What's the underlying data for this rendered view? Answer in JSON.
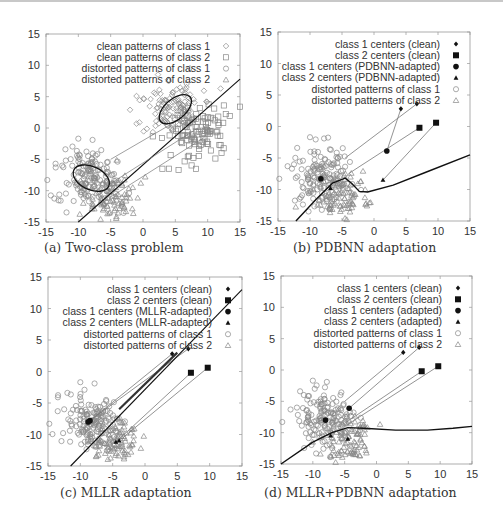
{
  "figure": {
    "panels": [
      {
        "id": "a",
        "caption": "(a) Two-class problem"
      },
      {
        "id": "b",
        "caption": "(b) PDBNN adaptation"
      },
      {
        "id": "c",
        "caption": "(c) MLLR adaptation"
      },
      {
        "id": "d",
        "caption": "(d) MLLR+PDBNN adaptation"
      }
    ]
  },
  "chart_data": [
    {
      "type": "scatter",
      "title": "(a) Two-class problem",
      "xlim": [
        -15,
        15
      ],
      "ylim": [
        -15,
        15
      ],
      "xticks": [
        -15,
        -10,
        -5,
        0,
        5,
        10,
        15
      ],
      "yticks": [
        -15,
        -10,
        -5,
        0,
        5,
        10,
        15
      ],
      "legend": [
        "clean patterns of class 1",
        "clean patterns of class 2",
        "distorted patterns of class 1",
        "distorted patterns of class 2"
      ],
      "legend_position": "upper right",
      "clusters": {
        "clean_class1_center": [
          5,
          3.5
        ],
        "clean_class2_center": [
          9,
          -0.5
        ],
        "distorted_class1_center": [
          -8,
          -8
        ],
        "distorted_class2_center": [
          -4,
          -11.5
        ]
      },
      "ellipses": [
        {
          "center": [
            5,
            3
          ],
          "rx": 3,
          "ry": 1.6,
          "angle": 40
        },
        {
          "center": [
            -8,
            -8
          ],
          "rx": 3,
          "ry": 1.8,
          "angle": -25
        }
      ],
      "lines": [
        {
          "from": [
            -10,
            -15
          ],
          "to": [
            15,
            7.8
          ]
        },
        {
          "from": [
            -5,
            -5
          ],
          "to": [
            5,
            1
          ]
        },
        {
          "from": [
            -6,
            -9.5
          ],
          "to": [
            8.5,
            0
          ]
        },
        {
          "from": [
            -5,
            -11
          ],
          "to": [
            9.5,
            -1.5
          ]
        }
      ]
    },
    {
      "type": "scatter",
      "title": "(b) PDBNN adaptation",
      "xlim": [
        -15,
        15
      ],
      "ylim": [
        -15,
        15
      ],
      "xticks": [
        -15,
        -10,
        -5,
        0,
        5,
        10,
        15
      ],
      "yticks": [
        -15,
        -10,
        -5,
        0,
        5,
        10,
        15
      ],
      "legend": [
        "class 1 centers (clean)",
        "class 2 centers (clean)",
        "class 1 centers (PDBNN-adapted)",
        "class 2 centers (PDBNN-adapted)",
        "distorted patterns of class 1",
        "distorted patterns of class 2"
      ],
      "clean_class1_centers": [
        [
          4.2,
          2.8
        ],
        [
          6.7,
          3.6
        ]
      ],
      "clean_class2_centers": [
        [
          7.1,
          -0.2
        ],
        [
          9.7,
          0.6
        ]
      ],
      "adapted_class1_centers": [
        [
          2,
          -3.9
        ],
        [
          -8.3,
          -8.3
        ]
      ],
      "adapted_class2_centers": [
        [
          1.4,
          -8.5
        ],
        [
          -6.8,
          -9.8
        ]
      ],
      "decision_boundary": [
        [
          -12.2,
          -15
        ],
        [
          -9,
          -11.5
        ],
        [
          -6.5,
          -9
        ],
        [
          -4.5,
          -8.2
        ],
        [
          -3.5,
          -9
        ],
        [
          -2.3,
          -10.3
        ],
        [
          -1,
          -10.4
        ],
        [
          3,
          -9.3
        ],
        [
          8,
          -7.3
        ],
        [
          15,
          -4.5
        ]
      ]
    },
    {
      "type": "scatter",
      "title": "(c) MLLR adaptation",
      "xlim": [
        -15,
        15
      ],
      "ylim": [
        -15,
        15
      ],
      "xticks": [
        -15,
        -10,
        -5,
        0,
        5,
        10,
        15
      ],
      "yticks": [
        -15,
        -10,
        -5,
        0,
        5,
        10,
        15
      ],
      "legend": [
        "class 1 centers (clean)",
        "class 2 centers (clean)",
        "class 1 centers (MLLR-adapted)",
        "class 2 centers (MLLR-adapted)",
        "distorted patterns of class 1",
        "distorted patterns of class 2"
      ],
      "clean_class1_centers": [
        [
          4.2,
          2.8
        ],
        [
          6.7,
          3.6
        ]
      ],
      "clean_class2_centers": [
        [
          7.1,
          -0.2
        ],
        [
          9.7,
          0.6
        ]
      ],
      "adapted_class1_centers": [
        [
          -8.5,
          -7.8
        ],
        [
          -8.8,
          -8
        ]
      ],
      "adapted_class2_centers": [
        [
          -4.5,
          -11.2
        ],
        [
          -4,
          -11
        ]
      ],
      "decision_boundary": [
        [
          -11.5,
          -15
        ],
        [
          15,
          13
        ]
      ]
    },
    {
      "type": "scatter",
      "title": "(d) MLLR+PDBNN adaptation",
      "xlim": [
        -15,
        15
      ],
      "ylim": [
        -15,
        15
      ],
      "xticks": [
        -15,
        -10,
        -5,
        0,
        5,
        10,
        15
      ],
      "yticks": [
        -15,
        -10,
        -5,
        0,
        5,
        10,
        15
      ],
      "legend": [
        "class 1 centers (clean)",
        "class 2 centers (clean)",
        "class 1 centers (adapted)",
        "class 2 centers (adapted)",
        "distorted patterns of class 1",
        "distorted patterns of class 2"
      ],
      "clean_class1_centers": [
        [
          4.2,
          2.8
        ],
        [
          6.7,
          3.6
        ]
      ],
      "clean_class2_centers": [
        [
          7.1,
          -0.2
        ],
        [
          9.7,
          0.6
        ]
      ],
      "adapted_class1_centers": [
        [
          -4.3,
          -6.1
        ],
        [
          -8,
          -8
        ]
      ],
      "adapted_class2_centers": [
        [
          -7.2,
          -10.5
        ],
        [
          -4.5,
          -11
        ]
      ],
      "decision_boundary": [
        [
          -15,
          -15
        ],
        [
          -10,
          -11.5
        ],
        [
          -7,
          -10
        ],
        [
          -4.5,
          -9.2
        ],
        [
          -2,
          -9.3
        ],
        [
          3,
          -9.6
        ],
        [
          8,
          -9.6
        ],
        [
          12,
          -9.3
        ],
        [
          15,
          -9
        ]
      ]
    }
  ]
}
